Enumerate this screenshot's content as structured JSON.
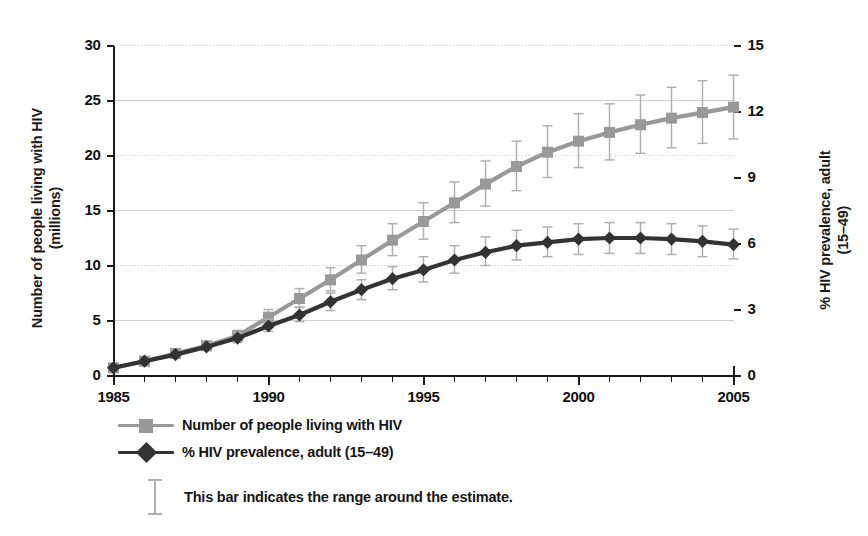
{
  "chart_data": {
    "type": "line",
    "title": "",
    "subtitle": "",
    "xlabel": "",
    "ylabel": "Number of people living with HIV (millions)",
    "y2label": "% HIV prevalence, adult (15–49)",
    "grid": true,
    "legend_position": "below-left",
    "x": [
      1985,
      1986,
      1987,
      1988,
      1989,
      1990,
      1991,
      1992,
      1993,
      1994,
      1995,
      1996,
      1997,
      1998,
      1999,
      2000,
      2001,
      2002,
      2003,
      2004,
      2005
    ],
    "xtick_labels": [
      "1985",
      "1990",
      "1995",
      "2000",
      "2005"
    ],
    "xtick_values": [
      1985,
      1990,
      1995,
      2000,
      2005
    ],
    "xlim": [
      1985,
      2005
    ],
    "ylim": [
      0,
      30
    ],
    "ytick_labels": [
      "0",
      "5",
      "10",
      "15",
      "20",
      "25",
      "30"
    ],
    "ytick_values": [
      0,
      5,
      10,
      15,
      20,
      25,
      30
    ],
    "y2lim": [
      0,
      15
    ],
    "y2tick_labels": [
      "0",
      "3",
      "6",
      "9",
      "12",
      "15"
    ],
    "y2tick_values": [
      0,
      3,
      6,
      9,
      12,
      15
    ],
    "series": [
      {
        "name": "Number of people living with HIV",
        "axis": "left",
        "color": "#999999",
        "marker": "square",
        "units": "millions",
        "values": [
          0.7,
          1.3,
          2.0,
          2.7,
          3.6,
          5.3,
          7.0,
          8.7,
          10.5,
          12.3,
          14.0,
          15.7,
          17.4,
          19.0,
          20.3,
          21.3,
          22.1,
          22.8,
          23.4,
          23.9,
          24.4
        ],
        "range_low": [
          0.6,
          1.2,
          1.8,
          2.4,
          3.2,
          4.7,
          6.2,
          7.7,
          9.3,
          10.9,
          12.4,
          13.9,
          15.4,
          16.8,
          18.0,
          18.9,
          19.6,
          20.2,
          20.7,
          21.1,
          21.5
        ],
        "range_high": [
          0.8,
          1.5,
          2.3,
          3.1,
          4.1,
          6.0,
          7.9,
          9.8,
          11.8,
          13.8,
          15.7,
          17.6,
          19.5,
          21.3,
          22.7,
          23.8,
          24.7,
          25.5,
          26.2,
          26.8,
          27.3
        ]
      },
      {
        "name": "% HIV prevalence, adult (15–49)",
        "axis": "right",
        "color": "#333333",
        "marker": "diamond",
        "units": "%",
        "values": [
          0.35,
          0.65,
          0.95,
          1.3,
          1.7,
          2.25,
          2.75,
          3.35,
          3.9,
          4.4,
          4.8,
          5.25,
          5.6,
          5.9,
          6.05,
          6.2,
          6.25,
          6.25,
          6.2,
          6.1,
          5.95
        ],
        "range_low": [
          0.3,
          0.58,
          0.85,
          1.15,
          1.5,
          2.0,
          2.45,
          2.95,
          3.45,
          3.9,
          4.25,
          4.65,
          5.0,
          5.25,
          5.4,
          5.5,
          5.55,
          5.55,
          5.5,
          5.4,
          5.3
        ],
        "range_high": [
          0.42,
          0.75,
          1.1,
          1.5,
          1.95,
          2.55,
          3.1,
          3.75,
          4.35,
          4.95,
          5.4,
          5.9,
          6.3,
          6.6,
          6.75,
          6.9,
          6.95,
          6.95,
          6.9,
          6.8,
          6.65
        ]
      }
    ],
    "legend": [
      {
        "label": "Number of people living with HIV",
        "color": "#999999",
        "marker": "square"
      },
      {
        "label": "% HIV prevalence, adult (15–49)",
        "color": "#333333",
        "marker": "diamond"
      }
    ],
    "annotations": [
      {
        "label": "This bar indicates the range around the estimate.",
        "marker": "error-bar",
        "color": "#b0b0b0"
      }
    ]
  },
  "axes": {
    "left_title": "Number of people living with HIV (millions)",
    "left_title_line1": "Number of people living with HIV",
    "left_title_line2": "(millions)",
    "right_title_line1": "% HIV prevalence, adult",
    "right_title_line2": "(15–49)"
  },
  "colors": {
    "series_gray": "#999999",
    "series_dark": "#333333",
    "error_bar": "#b0b0b0",
    "gridline": "#c8c8c8",
    "axis": "#1a1a1a",
    "background": "#ffffff"
  },
  "note": {
    "text": "This bar indicates the range around the estimate."
  }
}
